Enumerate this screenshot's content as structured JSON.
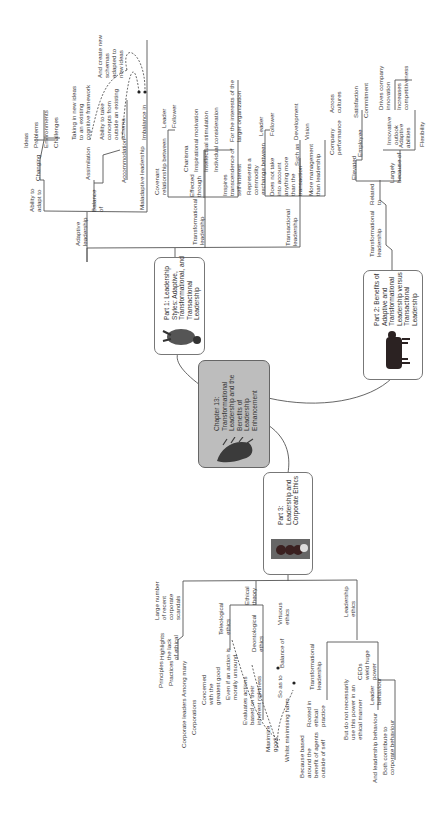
{
  "central": {
    "title": "Chapter 13:\nTransformational\nLeadership and the\nBenefits of\nLeadership\nEnhancement",
    "image_icon": "porcupine-image"
  },
  "parts": [
    {
      "id": "part1",
      "title": "Part 1: Leadership\nStyles: Adaptive,\nTransformational, and\nTransactional\nLeadership",
      "image_icon": "dog-image"
    },
    {
      "id": "part2",
      "title": "Part 2: Benefits of\nAdaptive and\nTransformational\nLeadership versus\nTransactional\nLeadership",
      "image_icon": "cow-image"
    },
    {
      "id": "part3",
      "title": "Part 3:\nLeadership and\nCorporate Ethics",
      "image_icon": "coins-image"
    }
  ],
  "part1_branches": {
    "adaptive": {
      "label": "Adaptive\nleadership",
      "ability": "Ability to\nadapt to",
      "changing": "Changing",
      "changing_items": [
        "Ideas",
        "Problems",
        "Environments",
        "Challenges"
      ],
      "balance": "Balance\nof",
      "assimilation": "Assimilation",
      "assimilation_desc": "Taking in new ideas\nto an existing\ncognitive framework",
      "accommodation": "Accommodation",
      "accommodation_desc": "Ability to take\nconcepts from\noutside an existing\nschema",
      "create_new": "And create new\nschemas\nadapted to\nnew ideas",
      "maladaptive": "Maladaptive leadership",
      "imbalance": "Imbalance in"
    },
    "transformational": {
      "label": "Transformational\nleadership",
      "covenant": "Covenant\nrelationship between",
      "covenant_items": [
        "Leader",
        "Follower"
      ],
      "effected": "Effected\nthrough",
      "effected_items": [
        "Charisma",
        "Inspirational motivation",
        "Intellectual stimulation",
        "Individual consideration"
      ],
      "inspires": "Inspires\ntranscendence of\nself-interest",
      "inspires_item": "For the interests of the\nlarger organization"
    },
    "transactional": {
      "label": "Transactional\nleadership",
      "represents": "Represents a\ncommodity\nexchange between",
      "represents_items": [
        "Leader",
        "Follower"
      ],
      "does_not": "Does not take\ninto account\nanything more\nthan the\ntransaction",
      "such_as": "Such as",
      "such_as_items": [
        "Development",
        "Vision"
      ],
      "more_mgmt": "More management\nthan leadership"
    }
  },
  "part2_branches": {
    "transformational": "Transformational\nleadership",
    "related_to": "Related\nto",
    "elevated": "Elevated",
    "company_perf": "Company\nperformance",
    "across": "Across\ncultures",
    "employee": "Employee",
    "employee_items": [
      "Satisfaction",
      "Commitment"
    ],
    "largely": "Largely\nbecause of",
    "innovative": "Innovative\noutlook",
    "drives": "Drives company\ninnovation",
    "increases": "Increases\ncompetitiveness",
    "adaptive_abilities": "Adaptive\nabilities",
    "flexibility": "Flexibility"
  },
  "part3_branches": {
    "scandals": "Large number\nof recent\ncorporate\nscandals",
    "highlights": "Highlights\nthe lack\nof ethical",
    "highlights_items": [
      "Principles",
      "Practices"
    ],
    "among_many": "Among many",
    "among_items": [
      "Corporate leaders",
      "Corporations"
    ],
    "ethical_theory": "Ethical\ntheory",
    "teleological": "Teleological\nethics",
    "concerned": "Concerned\nwith the\ngreatest good",
    "even_if": "Even if an action is\nmorally unsound",
    "deontological": "Deontological\nethics",
    "evaluates": "Evaluates actions\nbased on their\ninherent rightness",
    "virtuous": "Virtuous\nethics",
    "balance_of": "Balance of",
    "so_as_to": "So as to",
    "maximize": "Maximize\ngood",
    "whilst": "Whilst minimising harm",
    "leadership_ethics": "Leadership\nethics",
    "transformational": "Transformational\nleadership",
    "rooted": "Rooted in\nethical\npractice",
    "because": "Because based\naround the\nbenefit of agents\noutside of self",
    "ceos": "CEOs\nwield huge\npower",
    "but_not": "But do not necessarily\nuse this power in an\nethical manner",
    "leader_behaviour": "Leader\nbehaviour",
    "and_leadership": "And leadership behaviour",
    "both": "Both contribute to\ncorporate behaviour"
  },
  "colors": {
    "line": "#555555",
    "center_fill": "#bdbdbd",
    "text": "#3a3a3a"
  }
}
